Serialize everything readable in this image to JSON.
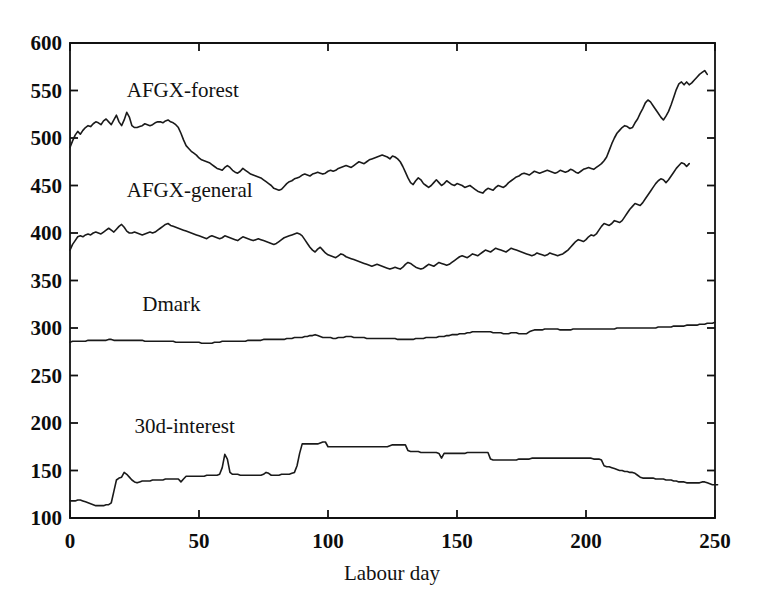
{
  "chart_data": {
    "type": "line",
    "title": "",
    "xlabel": "Labour day",
    "ylabel": "",
    "xlim": [
      0,
      250
    ],
    "ylim": [
      100,
      600
    ],
    "grid": false,
    "legend_position": "inline-annotations",
    "xticks": [
      0,
      50,
      100,
      150,
      200,
      250
    ],
    "xtick_labels": [
      "0",
      "50",
      "100",
      "150",
      "200",
      "250"
    ],
    "yticks": [
      100,
      150,
      200,
      250,
      300,
      350,
      400,
      450,
      500,
      550,
      600
    ],
    "ytick_labels": [
      "100",
      "150",
      "200",
      "250",
      "300",
      "350",
      "400",
      "450",
      "500",
      "550",
      "600"
    ],
    "annotations": [
      {
        "text": "AFGX-forest",
        "x": 22,
        "y": 543
      },
      {
        "text": "AFGX-general",
        "x": 22,
        "y": 438
      },
      {
        "text": "Dmark",
        "x": 28,
        "y": 318
      },
      {
        "text": "30d-interest",
        "x": 25,
        "y": 190
      }
    ],
    "series": [
      {
        "name": "AFGX-forest",
        "x_start": 0,
        "x_step": 1,
        "values": [
          490,
          497,
          503,
          507,
          504,
          508,
          511,
          513,
          512,
          515,
          517,
          516,
          514,
          518,
          520,
          517,
          514,
          519,
          524,
          517,
          513,
          519,
          527,
          522,
          513,
          511,
          511,
          512,
          513,
          515,
          514,
          513,
          514,
          516,
          517,
          517,
          516,
          518,
          519,
          517,
          516,
          514,
          511,
          505,
          498,
          492,
          489,
          486,
          484,
          482,
          479,
          477,
          476,
          475,
          474,
          472,
          470,
          468,
          467,
          466,
          469,
          471,
          469,
          466,
          464,
          463,
          465,
          468,
          466,
          464,
          462,
          461,
          460,
          459,
          458,
          456,
          454,
          452,
          450,
          447,
          446,
          445,
          446,
          449,
          452,
          454,
          455,
          457,
          458,
          459,
          461,
          462,
          461,
          460,
          462,
          463,
          464,
          463,
          462,
          463,
          465,
          466,
          465,
          466,
          468,
          469,
          470,
          471,
          470,
          469,
          471,
          473,
          475,
          474,
          473,
          475,
          477,
          478,
          479,
          480,
          481,
          482,
          481,
          480,
          478,
          481,
          480,
          478,
          475,
          470,
          464,
          458,
          453,
          451,
          455,
          458,
          456,
          452,
          450,
          448,
          450,
          453,
          456,
          453,
          450,
          452,
          455,
          453,
          451,
          450,
          452,
          451,
          450,
          448,
          449,
          450,
          448,
          446,
          444,
          443,
          442,
          445,
          447,
          446,
          445,
          448,
          450,
          449,
          448,
          450,
          453,
          455,
          457,
          459,
          460,
          462,
          463,
          462,
          461,
          463,
          465,
          464,
          463,
          464,
          465,
          466,
          465,
          464,
          463,
          464,
          466,
          465,
          464,
          465,
          467,
          466,
          464,
          463,
          465,
          467,
          468,
          469,
          468,
          467,
          469,
          471,
          473,
          476,
          480,
          487,
          494,
          500,
          505,
          508,
          511,
          513,
          512,
          510,
          511,
          516,
          520,
          526,
          531,
          537,
          540,
          538,
          534,
          530,
          526,
          522,
          519,
          523,
          528,
          535,
          543,
          551,
          557,
          559,
          556,
          559,
          556,
          558,
          561,
          564,
          567,
          569,
          571,
          567
        ]
      },
      {
        "name": "AFGX-general",
        "x_start": 0,
        "x_step": 1,
        "values": [
          382,
          388,
          392,
          396,
          397,
          396,
          398,
          399,
          398,
          400,
          401,
          400,
          399,
          401,
          403,
          405,
          403,
          401,
          404,
          407,
          409,
          406,
          402,
          400,
          400,
          401,
          400,
          399,
          398,
          399,
          400,
          401,
          400,
          401,
          403,
          405,
          407,
          409,
          410,
          408,
          407,
          406,
          405,
          404,
          403,
          402,
          401,
          400,
          399,
          398,
          397,
          396,
          395,
          394,
          396,
          397,
          396,
          395,
          394,
          395,
          397,
          396,
          395,
          394,
          393,
          392,
          394,
          396,
          395,
          394,
          393,
          392,
          393,
          394,
          393,
          392,
          391,
          390,
          389,
          388,
          389,
          391,
          393,
          395,
          396,
          397,
          398,
          399,
          400,
          399,
          397,
          393,
          389,
          385,
          382,
          380,
          383,
          385,
          382,
          379,
          377,
          376,
          375,
          374,
          376,
          378,
          377,
          375,
          374,
          373,
          372,
          371,
          370,
          369,
          368,
          367,
          366,
          365,
          366,
          367,
          366,
          365,
          364,
          363,
          362,
          363,
          364,
          363,
          362,
          364,
          367,
          369,
          368,
          366,
          364,
          363,
          362,
          363,
          365,
          367,
          366,
          365,
          367,
          369,
          368,
          367,
          366,
          367,
          369,
          371,
          373,
          375,
          376,
          375,
          374,
          376,
          378,
          377,
          376,
          378,
          380,
          382,
          381,
          380,
          382,
          384,
          383,
          382,
          381,
          380,
          382,
          384,
          383,
          382,
          381,
          380,
          379,
          378,
          377,
          376,
          377,
          379,
          378,
          377,
          376,
          377,
          379,
          378,
          377,
          376,
          377,
          378,
          380,
          382,
          385,
          388,
          391,
          393,
          392,
          391,
          393,
          396,
          398,
          397,
          399,
          403,
          407,
          410,
          409,
          408,
          410,
          413,
          412,
          411,
          413,
          417,
          421,
          425,
          428,
          431,
          430,
          429,
          432,
          436,
          440,
          444,
          448,
          452,
          455,
          457,
          456,
          453,
          456,
          460,
          464,
          468,
          471,
          474,
          473,
          470,
          473
        ]
      },
      {
        "name": "Dmark",
        "x_start": 0,
        "x_step": 1,
        "values": [
          285,
          286,
          286,
          286,
          286,
          286,
          286,
          287,
          287,
          287,
          287,
          287,
          287,
          287,
          287,
          288,
          288,
          287,
          287,
          287,
          287,
          287,
          287,
          287,
          287,
          287,
          287,
          287,
          287,
          286,
          286,
          286,
          286,
          286,
          286,
          286,
          286,
          286,
          286,
          286,
          286,
          285,
          285,
          285,
          285,
          285,
          285,
          285,
          285,
          285,
          285,
          284,
          284,
          284,
          284,
          284,
          285,
          285,
          285,
          286,
          286,
          286,
          286,
          286,
          286,
          286,
          286,
          286,
          286,
          287,
          287,
          287,
          287,
          287,
          287,
          288,
          288,
          288,
          288,
          288,
          288,
          288,
          288,
          288,
          289,
          289,
          289,
          290,
          290,
          290,
          290,
          291,
          291,
          292,
          292,
          293,
          292,
          291,
          290,
          290,
          290,
          290,
          289,
          289,
          290,
          290,
          290,
          291,
          291,
          291,
          290,
          290,
          290,
          290,
          290,
          289,
          289,
          289,
          289,
          289,
          289,
          289,
          289,
          289,
          289,
          289,
          289,
          288,
          288,
          288,
          288,
          288,
          288,
          288,
          289,
          289,
          289,
          289,
          290,
          290,
          290,
          290,
          290,
          291,
          291,
          291,
          292,
          292,
          293,
          293,
          293,
          294,
          294,
          294,
          295,
          295,
          296,
          296,
          296,
          296,
          296,
          296,
          296,
          296,
          295,
          295,
          295,
          295,
          294,
          294,
          294,
          295,
          295,
          295,
          294,
          294,
          294,
          294,
          296,
          297,
          298,
          298,
          298,
          298,
          299,
          299,
          299,
          299,
          299,
          299,
          298,
          298,
          298,
          298,
          298,
          299,
          299,
          299,
          299,
          299,
          299,
          299,
          299,
          299,
          299,
          299,
          299,
          299,
          299,
          299,
          299,
          299,
          300,
          300,
          300,
          300,
          300,
          300,
          300,
          300,
          300,
          300,
          300,
          300,
          300,
          300,
          300,
          300,
          301,
          301,
          301,
          301,
          301,
          301,
          302,
          302,
          302,
          302,
          302,
          303,
          303,
          303,
          303,
          303,
          304,
          304,
          304,
          305,
          305,
          305,
          306
        ]
      },
      {
        "name": "30d-interest",
        "x_start": 0,
        "x_step": 1,
        "values": [
          118,
          118,
          118,
          119,
          119,
          118,
          117,
          116,
          115,
          114,
          113,
          113,
          113,
          113,
          114,
          114,
          116,
          128,
          140,
          142,
          143,
          148,
          146,
          143,
          140,
          138,
          137,
          138,
          139,
          139,
          139,
          139,
          140,
          140,
          140,
          140,
          140,
          141,
          141,
          141,
          141,
          141,
          141,
          138,
          141,
          144,
          144,
          144,
          144,
          144,
          144,
          144,
          144,
          145,
          145,
          145,
          145,
          145,
          146,
          153,
          167,
          162,
          148,
          146,
          146,
          146,
          145,
          145,
          145,
          145,
          145,
          145,
          145,
          145,
          145,
          146,
          148,
          147,
          145,
          145,
          145,
          145,
          146,
          146,
          146,
          146,
          147,
          148,
          155,
          168,
          178,
          178,
          178,
          178,
          178,
          178,
          178,
          179,
          180,
          180,
          175,
          175,
          175,
          175,
          175,
          175,
          175,
          175,
          175,
          175,
          175,
          175,
          175,
          175,
          175,
          175,
          175,
          175,
          175,
          175,
          175,
          175,
          175,
          175,
          176,
          177,
          177,
          177,
          177,
          177,
          177,
          171,
          170,
          170,
          170,
          170,
          169,
          169,
          169,
          169,
          169,
          169,
          169,
          168,
          163,
          168,
          168,
          168,
          168,
          168,
          168,
          168,
          168,
          168,
          169,
          169,
          169,
          169,
          169,
          169,
          169,
          169,
          169,
          162,
          161,
          161,
          161,
          161,
          161,
          161,
          161,
          161,
          161,
          161,
          162,
          162,
          162,
          162,
          162,
          163,
          163,
          163,
          163,
          163,
          163,
          163,
          163,
          163,
          163,
          163,
          163,
          163,
          163,
          163,
          163,
          163,
          163,
          163,
          163,
          163,
          163,
          163,
          163,
          162,
          162,
          162,
          161,
          155,
          154,
          154,
          153,
          152,
          151,
          150,
          150,
          149,
          149,
          148,
          148,
          147,
          145,
          143,
          142,
          142,
          142,
          142,
          142,
          141,
          141,
          141,
          141,
          140,
          140,
          140,
          139,
          139,
          138,
          138,
          138,
          137,
          137,
          137,
          137,
          137,
          137,
          138,
          138,
          137,
          136,
          135,
          135,
          135
        ]
      }
    ]
  },
  "axes": {
    "x_axis_title": "Labour day"
  },
  "colors": {
    "line": "#1a1a1a",
    "axis": "#111111",
    "background": "#ffffff"
  }
}
